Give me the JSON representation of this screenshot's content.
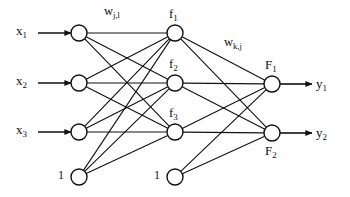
{
  "diagram": {
    "ink_color": "#111111",
    "background_color": "#fefefe",
    "node_fill": "#ffffff",
    "inputs": [
      {
        "name": "x1",
        "base": "x",
        "sub": "1",
        "cx": 79,
        "cy": 33
      },
      {
        "name": "x2",
        "base": "x",
        "sub": "2",
        "cx": 79,
        "cy": 83
      },
      {
        "name": "x3",
        "base": "x",
        "sub": "3",
        "cx": 79,
        "cy": 132
      }
    ],
    "hidden": [
      {
        "name": "f1",
        "base": "f",
        "sub": "1",
        "cx": 175,
        "cy": 33
      },
      {
        "name": "f2",
        "base": "f",
        "sub": "2",
        "cx": 175,
        "cy": 83
      },
      {
        "name": "f3",
        "base": "f",
        "sub": "3",
        "cx": 175,
        "cy": 132
      }
    ],
    "outputs": [
      {
        "name": "F1",
        "base": "F",
        "sub": "1",
        "cx": 272,
        "cy": 84
      },
      {
        "name": "F2",
        "base": "F",
        "sub": "2",
        "cx": 272,
        "cy": 133
      }
    ],
    "biases": [
      {
        "name": "bias-input-layer",
        "label": "1",
        "cx": 79,
        "cy": 177
      },
      {
        "name": "bias-hidden-layer",
        "label": "1",
        "cx": 175,
        "cy": 177
      }
    ],
    "output_labels": [
      {
        "name": "y1",
        "base": "y",
        "sub": "1",
        "x": 316,
        "y": 77
      },
      {
        "name": "y2",
        "base": "y",
        "sub": "2",
        "x": 316,
        "y": 126
      }
    ],
    "weight_labels": [
      {
        "name": "w-j-l",
        "base": "w",
        "sub": "j,l",
        "x": 104,
        "y": 5
      },
      {
        "name": "w-k-j",
        "base": "w",
        "sub": "k,j",
        "x": 224,
        "y": 36
      }
    ],
    "node_radius": 8,
    "stroke_width": 1.1,
    "edges": {
      "input_to_hidden_count": 9,
      "hidden_to_output_count": 6,
      "bias1_to_hidden_count": 3,
      "bias2_to_output_count": 2
    }
  }
}
